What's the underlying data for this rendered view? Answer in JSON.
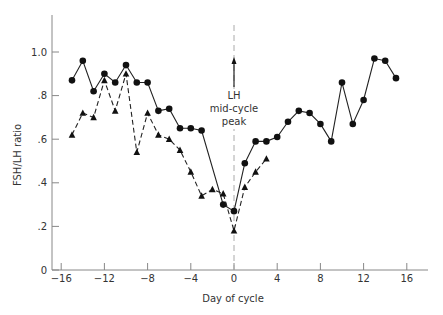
{
  "chart_data": {
    "type": "line",
    "title": "",
    "xlabel": "Day of cycle",
    "ylabel": "FSH/LH ratio",
    "xlim": [
      -17,
      18
    ],
    "ylim": [
      0,
      1.15
    ],
    "grid": false,
    "legend": null,
    "x_ticks": [
      -16,
      -12,
      -8,
      -4,
      0,
      4,
      8,
      12,
      16
    ],
    "x_tick_labels": [
      "−16",
      "−12",
      "−8",
      "−4",
      "0",
      "4",
      "8",
      "12",
      "16"
    ],
    "y_ticks": [
      0,
      0.2,
      0.4,
      0.6,
      0.8,
      1.0
    ],
    "y_tick_labels": [
      "0",
      ".2",
      ".4",
      ".6",
      ".8",
      "1.0"
    ],
    "series": [
      {
        "name": "circles-solid",
        "marker": "circle",
        "line": "solid",
        "x": [
          -15,
          -14,
          -13,
          -12,
          -11,
          -10,
          -9,
          -8,
          -7,
          -6,
          -5,
          -4,
          -3,
          -1,
          0,
          1,
          2,
          3,
          4,
          5,
          6,
          7,
          8,
          9,
          10,
          11,
          12,
          13,
          14,
          15
        ],
        "values": [
          0.87,
          0.96,
          0.82,
          0.9,
          0.86,
          0.94,
          0.86,
          0.86,
          0.73,
          0.74,
          0.65,
          0.65,
          0.64,
          0.3,
          0.27,
          0.49,
          0.59,
          0.59,
          0.61,
          0.68,
          0.73,
          0.72,
          0.67,
          0.59,
          0.86,
          0.67,
          0.78,
          0.97,
          0.96,
          0.88
        ]
      },
      {
        "name": "triangles-dashed",
        "marker": "triangle",
        "line": "dashed",
        "x": [
          -15,
          -14,
          -13,
          -12,
          -11,
          -10,
          -9,
          -8,
          -7,
          -6,
          -5,
          -4,
          -3,
          -2,
          -1,
          0,
          1,
          2,
          3
        ],
        "values": [
          0.62,
          0.72,
          0.7,
          0.87,
          0.73,
          0.9,
          0.54,
          0.72,
          0.62,
          0.6,
          0.55,
          0.45,
          0.34,
          0.37,
          0.35,
          0.18,
          0.38,
          0.45,
          0.51
        ]
      }
    ],
    "annotations": [
      {
        "text_lines": [
          "LH",
          "mid-cycle",
          "peak"
        ],
        "x": 0,
        "arrow": "up",
        "vertical_dashed_line_at_x": 0
      }
    ]
  }
}
